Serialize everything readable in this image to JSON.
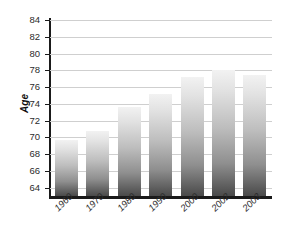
{
  "chart_data": {
    "type": "bar",
    "title": "",
    "subtitle": "",
    "xlabel": "",
    "ylabel": "Age",
    "categories": [
      "1960",
      "1970",
      "1980",
      "1990",
      "2000",
      "2002",
      "2003"
    ],
    "values": [
      69.7,
      70.8,
      73.6,
      75.2,
      77.2,
      78.0,
      77.4
    ],
    "series": [
      {
        "name": "Age",
        "values": [
          69.7,
          70.8,
          73.6,
          75.2,
          77.2,
          78.0,
          77.4
        ]
      }
    ],
    "ylim": [
      63.0,
      84.0
    ],
    "y_ticks": [
      64,
      66,
      68,
      70,
      72,
      74,
      76,
      78,
      80,
      82,
      84
    ],
    "y_tick_labels": [
      "64",
      "66",
      "68",
      "70",
      "72",
      "74",
      "76",
      "78",
      "80",
      "82",
      "84"
    ],
    "grid": true,
    "grid_axis": "y",
    "legend": false,
    "legend_position": "none",
    "bar_fill_top_color": "#f2f2f2",
    "bar_fill_bottom_color": "#4a4a4a",
    "gridline_color": "#cfcfcf",
    "axis_color": "#1a1a1a",
    "background_color": "#ffffff",
    "text_color": "#2b2b2b"
  }
}
